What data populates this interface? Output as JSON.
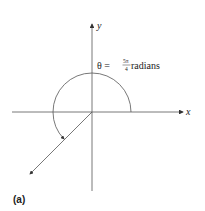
{
  "figure": {
    "panel_label": "(a)",
    "axes": {
      "x_label": "x",
      "y_label": "y"
    },
    "angle_label": {
      "prefix": "θ = ",
      "numerator": "5π",
      "denominator": "4",
      "suffix": " radians"
    },
    "angle_value": "5π/4",
    "colors": {
      "line": "#555555",
      "text": "#222222",
      "background": "#ffffff"
    }
  }
}
